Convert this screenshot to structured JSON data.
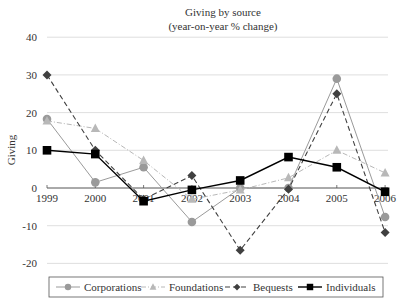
{
  "chart_data": {
    "type": "line",
    "title": "Giving by source",
    "subtitle": "(year-on-year % change)",
    "xlabel": "",
    "ylabel": "Giving",
    "x": [
      "1999",
      "2000",
      "2001",
      "2002",
      "2003",
      "2004",
      "2005",
      "2006"
    ],
    "ylim": [
      -20,
      40
    ],
    "yticks": [
      40,
      30,
      20,
      10,
      0,
      -10,
      -20
    ],
    "grid": true,
    "legend_position": "bottom",
    "series": [
      {
        "name": "Corporations",
        "marker": "circle",
        "line": "solid-light",
        "color": "#9a9a9a",
        "values": [
          18.3,
          1.5,
          5.5,
          -9.0,
          0.0,
          0.0,
          29.0,
          -7.7
        ]
      },
      {
        "name": "Foundations",
        "marker": "triangle",
        "line": "dash-dot",
        "color": "#b8b8b8",
        "values": [
          17.8,
          15.8,
          7.3,
          -3.0,
          -0.5,
          2.7,
          10.0,
          4.0
        ]
      },
      {
        "name": "Bequests",
        "marker": "diamond",
        "line": "dashed",
        "color": "#404040",
        "values": [
          30.0,
          10.0,
          -3.0,
          3.3,
          -16.5,
          -0.3,
          25.0,
          -11.8
        ]
      },
      {
        "name": "Individuals",
        "marker": "square",
        "line": "solid",
        "color": "#000000",
        "values": [
          10.0,
          9.0,
          -3.5,
          -0.5,
          2.0,
          8.2,
          5.5,
          -1.0
        ]
      }
    ]
  }
}
